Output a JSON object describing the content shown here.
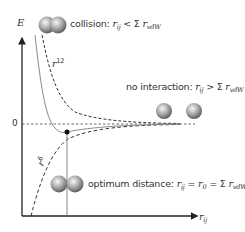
{
  "diagram": {
    "y_axis_label": "E",
    "x_axis_label": {
      "main": "r",
      "sub": "ij"
    },
    "zero_label": "0",
    "curve_labels": {
      "repulsive": {
        "main": "r",
        "sup": "12"
      },
      "attractive": {
        "main": "r",
        "sup": "6"
      }
    },
    "annotations": {
      "collision": {
        "prefix": "collision: ",
        "r": "r",
        "r_sub": "ij",
        "relation": " < Σ ",
        "r2": "r",
        "r2_sub": "vdW"
      },
      "no_interaction": {
        "prefix": "no interaction: ",
        "r": "r",
        "r_sub": "ij",
        "relation": " > Σ ",
        "r2": "r",
        "r2_sub": "vdW"
      },
      "optimum": {
        "prefix": "optimum distance: ",
        "r": "r",
        "r_sub": "ij",
        "eq1": " = ",
        "r0": "r",
        "r0_sub": "0",
        "relation": " = Σ ",
        "r2": "r",
        "r2_sub": "vdW"
      }
    },
    "colors": {
      "axis": "#222222",
      "solid_curve": "#8a8a8a",
      "dashed_curve": "#333333",
      "sphere_light": "#f2f2f2",
      "sphere_dark": "#6e6e6e"
    }
  }
}
